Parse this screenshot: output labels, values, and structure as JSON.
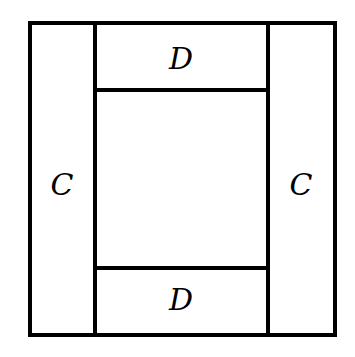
{
  "diagram": {
    "title": "",
    "regions": [
      {
        "id": "left",
        "label": "C"
      },
      {
        "id": "top",
        "label": "D"
      },
      {
        "id": "right",
        "label": "C"
      },
      {
        "id": "bottom",
        "label": "D"
      },
      {
        "id": "center",
        "label": ""
      }
    ]
  }
}
